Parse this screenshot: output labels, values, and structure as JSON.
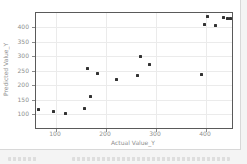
{
  "styles": {
    "page_bg": "#f4f4f4",
    "panel_bg": "#ffffff",
    "panel_border": "#d8d8d8",
    "axis_color": "#5a5a5a",
    "grid_color": "#ebebeb",
    "tick_color": "#8a8a8a",
    "label_color": "#8f8f8f",
    "point_color": "#333333"
  },
  "chart_data": {
    "type": "scatter",
    "title": "",
    "xlabel": "Actual Value_Y",
    "ylabel": "Predicted Value_Y",
    "xlim": [
      60,
      452
    ],
    "ylim": [
      53,
      448
    ],
    "x_ticks": [
      100,
      200,
      300,
      400
    ],
    "y_ticks": [
      100,
      150,
      200,
      250,
      300,
      350,
      400
    ],
    "grid": true,
    "legend": "none",
    "marker": {
      "shape": "square",
      "size_px": 3,
      "color": "#333333"
    },
    "points": [
      {
        "x": 64,
        "y": 117
      },
      {
        "x": 95,
        "y": 110
      },
      {
        "x": 119,
        "y": 104
      },
      {
        "x": 157,
        "y": 120
      },
      {
        "x": 168,
        "y": 162
      },
      {
        "x": 163,
        "y": 257
      },
      {
        "x": 183,
        "y": 240
      },
      {
        "x": 221,
        "y": 220
      },
      {
        "x": 262,
        "y": 235
      },
      {
        "x": 269,
        "y": 297
      },
      {
        "x": 286,
        "y": 272
      },
      {
        "x": 390,
        "y": 238
      },
      {
        "x": 396,
        "y": 407
      },
      {
        "x": 418,
        "y": 405
      },
      {
        "x": 403,
        "y": 435
      },
      {
        "x": 434,
        "y": 432
      },
      {
        "x": 442,
        "y": 430
      },
      {
        "x": 449,
        "y": 430
      }
    ]
  }
}
